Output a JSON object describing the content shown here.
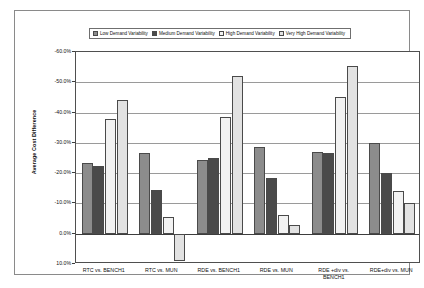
{
  "chart_data": {
    "type": "bar",
    "title": "",
    "subtitle": "",
    "xlabel": "",
    "ylabel": "Average Cost Difference",
    "categories": [
      "RTC vs. BENCH1",
      "RTC vs. MUN",
      "RDE vs. BENCH1",
      "RDE vs. MUN",
      "RDE+div vs. BENCH1",
      "RDE+div vs. MUN"
    ],
    "categories_display": [
      "RTC vs. BENCH1",
      "RTC vs. MUN",
      "RDE vs. BENCH1",
      "RDE vs. MUN",
      "RDE +div vs.\nBENCH1",
      "RDE+div vs. MUN"
    ],
    "series": [
      {
        "name": "Low Demand Variability",
        "color": "#8c8c8c",
        "values": [
          -23.3,
          -26.5,
          -24.5,
          -28.5,
          -27.0,
          -30.0
        ]
      },
      {
        "name": "Medium Demand Variability",
        "color": "#4a4a4a",
        "values": [
          -22.5,
          -14.5,
          -25.0,
          -18.5,
          -26.5,
          -20.0
        ]
      },
      {
        "name": "High Demand Variability",
        "color": "#f2f2f2",
        "values": [
          -37.8,
          -5.5,
          -38.5,
          -6.3,
          -45.0,
          -14.0
        ]
      },
      {
        "name": "Very High Demand Variability",
        "color": "#e2e2e2",
        "values": [
          -44.0,
          9.0,
          -52.0,
          -3.0,
          -55.5,
          -10.0
        ]
      }
    ],
    "ylim": [
      -60.0,
      10.0
    ],
    "y_ticks": [
      -60.0,
      -50.0,
      -40.0,
      -30.0,
      -20.0,
      -10.0,
      0.0,
      10.0
    ],
    "y_tick_labels": [
      "-60.0%",
      "-50.0%",
      "-40.0%",
      "-30.0%",
      "-20.0%",
      "-10.0%",
      "0.0%",
      "10.0%"
    ],
    "y_axis_inverted": true,
    "grid": true,
    "legend_position": "top"
  },
  "legend": {
    "items": [
      {
        "label": "Low Demand Variability",
        "color": "#8c8c8c"
      },
      {
        "label": "Medium Demand Variability",
        "color": "#4a4a4a"
      },
      {
        "label": "High Demand Variability",
        "color": "#f2f2f2"
      },
      {
        "label": "Very High Demand Variability",
        "color": "#e2e2e2"
      }
    ]
  }
}
